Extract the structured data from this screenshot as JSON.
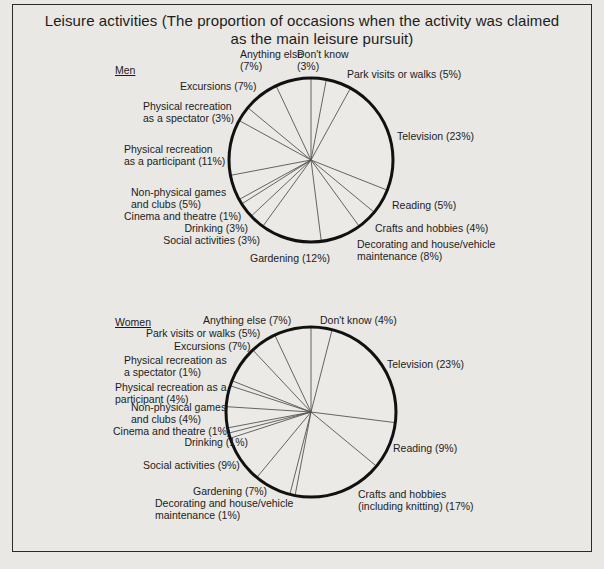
{
  "title": {
    "line1": "Leisure activities  (The proportion of occasions when the activity was claimed",
    "line2": "as the main leisure pursuit)"
  },
  "men": {
    "label": "Men",
    "labels": {
      "dont_know": "Don't know\n(3%)",
      "park": "Park visits or walks (5%)",
      "television": "Television (23%)",
      "reading": "Reading (5%)",
      "crafts": "Crafts and hobbies (4%)",
      "decorating": "Decorating and house/vehicle\nmaintenance (8%)",
      "gardening": "Gardening (12%)",
      "social": "Social activities (3%)",
      "drinking": "Drinking (3%)",
      "cinema": "Cinema and theatre (1%)",
      "nonphysical": "Non-physical games\nand clubs (5%)",
      "participant": "Physical recreation\nas a participant (11%)",
      "spectator": "Physical recreation\nas a spectator (3%)",
      "excursions": "Excursions (7%)",
      "anything": "Anything else\n(7%)"
    }
  },
  "women": {
    "label": "Women",
    "labels": {
      "dont_know": "Don't know (4%)",
      "television": "Television (23%)",
      "reading": "Reading (9%)",
      "crafts": "Crafts and hobbies\n(including knitting) (17%)",
      "decorating": "Decorating and house/vehicle\nmaintenance (1%)",
      "gardening": "Gardening (7%)",
      "social": "Social activities (9%)",
      "drinking": "Drinking (1%)",
      "cinema": "Cinema and theatre (1%)",
      "nonphysical": "Non-physical games\nand clubs (4%)",
      "participant": "Physical recreation as a\nparticipant (4%)",
      "spectator": "Physical recreation as\na spectator (1%)",
      "excursions": "Excursions (7%)",
      "park": "Park visits or walks (5%)",
      "anything": "Anything else (7%)"
    }
  },
  "chart_data": [
    {
      "type": "pie",
      "title": "Leisure activities (The proportion of occasions when the activity was claimed as the main leisure pursuit) — Men",
      "direction": "clockwise from 12 o'clock",
      "categories": [
        "Don't know",
        "Park visits or walks",
        "Television",
        "Reading",
        "Crafts and hobbies",
        "Decorating and house/vehicle maintenance",
        "Gardening",
        "Social activities",
        "Drinking",
        "Cinema and theatre",
        "Non-physical games and clubs",
        "Physical recreation as a participant",
        "Physical recreation as a spectator",
        "Excursions",
        "Anything else"
      ],
      "values": [
        3,
        5,
        23,
        5,
        4,
        8,
        12,
        3,
        3,
        1,
        5,
        11,
        3,
        7,
        7
      ],
      "unit": "%"
    },
    {
      "type": "pie",
      "title": "Leisure activities (The proportion of occasions when the activity was claimed as the main leisure pursuit) — Women",
      "direction": "clockwise from 12 o'clock",
      "categories": [
        "Don't know",
        "Television",
        "Reading",
        "Crafts and hobbies (including knitting)",
        "Decorating and house/vehicle maintenance",
        "Gardening",
        "Social activities",
        "Drinking",
        "Cinema and theatre",
        "Non-physical games and clubs",
        "Physical recreation as a participant",
        "Physical recreation as a spectator",
        "Excursions",
        "Park visits or walks",
        "Anything else"
      ],
      "values": [
        4,
        23,
        9,
        17,
        1,
        7,
        9,
        1,
        1,
        4,
        4,
        1,
        7,
        5,
        7
      ],
      "unit": "%"
    }
  ]
}
